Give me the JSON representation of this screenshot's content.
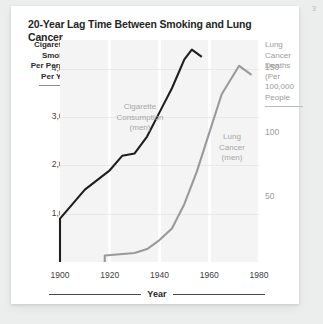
{
  "page": {
    "corner_marker": "3"
  },
  "card": {
    "title": "20-Year Lag Time Between Smoking and Lung Cancer"
  },
  "axes": {
    "left_caption": "Cigarettes\nSmoked\nPer Person\nPer Year",
    "right_caption": "Lung\nCancer\nDeaths\n(Per\n100,000\nPeople",
    "x_title": "Year"
  },
  "chart_data": {
    "type": "line",
    "title": "20-Year Lag Time Between Smoking and Lung Cancer",
    "xlabel": "Year",
    "ylabel": "Cigarettes Smoked Per Person Per Year",
    "y2label": "Lung Cancer Deaths (Per 100,000 People",
    "xlim": [
      1900,
      1980
    ],
    "xticks": [
      1900,
      1920,
      1940,
      1960,
      1980
    ],
    "ylim": [
      0,
      4600
    ],
    "yticks": [
      1000,
      2000,
      3000,
      4000
    ],
    "y2lim": [
      0,
      172
    ],
    "y2ticks": [
      50,
      100,
      150
    ],
    "grid": "vertical-bands",
    "legend": "inline-annotations",
    "series": [
      {
        "name": "Cigarette Consumption (men)",
        "annotation": "Cigarette\nConsumption\n(men)",
        "axis": "left",
        "color": "#1f1f1f",
        "x": [
          1900,
          1900,
          1910,
          1920,
          1925,
          1930,
          1935,
          1940,
          1945,
          1950,
          1953,
          1957
        ],
        "values": [
          0,
          900,
          1500,
          1900,
          2200,
          2250,
          2600,
          3100,
          3600,
          4200,
          4400,
          4250
        ]
      },
      {
        "name": "Lung Cancer (men)",
        "annotation": "Lung\nCancer\n(men)",
        "axis": "right",
        "color": "#9a9a9a",
        "x": [
          1918,
          1918,
          1930,
          1935,
          1940,
          1945,
          1950,
          1955,
          1960,
          1965,
          1972,
          1977
        ],
        "values": [
          0,
          5,
          7,
          10,
          17,
          26,
          45,
          70,
          100,
          130,
          152,
          145
        ]
      }
    ]
  }
}
